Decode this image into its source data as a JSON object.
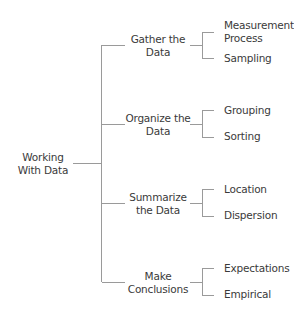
{
  "diagram": {
    "type": "tree",
    "line_color": "#9a9a9a",
    "text_color": "#3a3a3a",
    "root": {
      "line1": "Working",
      "line2": "With Data"
    },
    "branches": [
      {
        "line1": "Gather the",
        "line2": "Data",
        "children": [
          {
            "line1": "Measurement",
            "line2": "Process"
          },
          {
            "line1": "Sampling",
            "line2": ""
          }
        ]
      },
      {
        "line1": "Organize the",
        "line2": "Data",
        "children": [
          {
            "line1": "Grouping",
            "line2": ""
          },
          {
            "line1": "Sorting",
            "line2": ""
          }
        ]
      },
      {
        "line1": "Summarize",
        "line2": "the Data",
        "children": [
          {
            "line1": "Location",
            "line2": ""
          },
          {
            "line1": "Dispersion",
            "line2": ""
          }
        ]
      },
      {
        "line1": "Make",
        "line2": "Conclusions",
        "children": [
          {
            "line1": "Expectations",
            "line2": ""
          },
          {
            "line1": "Empirical",
            "line2": ""
          }
        ]
      }
    ]
  }
}
